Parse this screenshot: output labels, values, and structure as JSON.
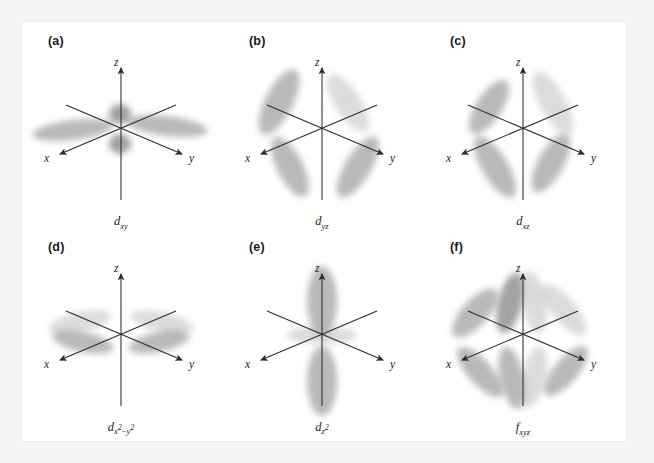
{
  "figure": {
    "title_visible": false,
    "background_color": "#f4f4f4",
    "panel_color": "#ffffff",
    "lobe_color": "#8f8f8f",
    "axis_color": "#2b2b2b",
    "text_color": "#1c1c1c",
    "axis_labels": {
      "x": "x",
      "y": "y",
      "z": "z"
    },
    "panels": [
      {
        "letter": "(a)",
        "orbital_base": "d",
        "orbital_subscript": "xy",
        "orbital_label": "d_xy",
        "lobe_count": 4,
        "description": "two broad lobes along x and y in the horizontal plane plus two small lobes near the z axis"
      },
      {
        "letter": "(b)",
        "orbital_base": "d",
        "orbital_subscript": "yz",
        "orbital_label": "d_yz",
        "lobe_count": 4,
        "description": "four lobes at 45 degrees between the y and z axes"
      },
      {
        "letter": "(c)",
        "orbital_base": "d",
        "orbital_subscript": "xz",
        "orbital_label": "d_xz",
        "lobe_count": 4,
        "description": "four lobes at 45 degrees between the x and z axes"
      },
      {
        "letter": "(d)",
        "orbital_base": "d",
        "orbital_subscript_main": "x",
        "orbital_sup_1": "2",
        "orbital_operator": "−",
        "orbital_subscript_2": "y",
        "orbital_sup_2": "2",
        "orbital_label": "d_x2-y2",
        "lobe_count": 4,
        "description": "four flattened lobes lying along the x and y axes"
      },
      {
        "letter": "(e)",
        "orbital_base": "d",
        "orbital_subscript_main": "z",
        "orbital_sup_1": "2",
        "orbital_label": "d_z2",
        "lobe_count": 2,
        "description": "two large lobes along the z axis with a torus around the origin"
      },
      {
        "letter": "(f)",
        "orbital_base": "f",
        "orbital_subscript": "xyz",
        "orbital_label": "f_xyz",
        "lobe_count": 8,
        "description": "eight lobes pointing toward the corners of a cube"
      }
    ]
  }
}
